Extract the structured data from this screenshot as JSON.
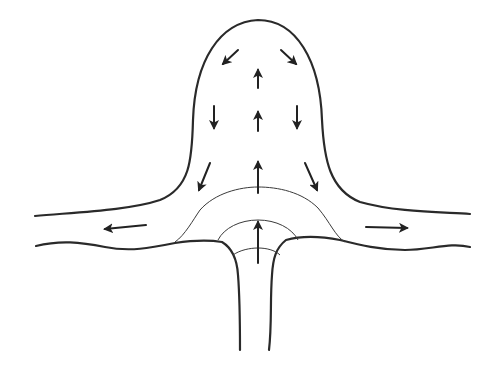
{
  "diagram": {
    "stroke_color": "#2a2a2a",
    "background": "#ffffff",
    "arrows": [
      {
        "id": "head-upper-left",
        "direction": "down-left",
        "x": 230,
        "y": 58
      },
      {
        "id": "head-upper-right",
        "direction": "down-right",
        "x": 290,
        "y": 58
      },
      {
        "id": "head-top-center",
        "direction": "up",
        "x": 258,
        "y": 78
      },
      {
        "id": "head-mid-left",
        "direction": "down",
        "x": 213,
        "y": 112
      },
      {
        "id": "head-mid-center",
        "direction": "up",
        "x": 258,
        "y": 120
      },
      {
        "id": "head-mid-right",
        "direction": "down",
        "x": 298,
        "y": 112
      },
      {
        "id": "head-low-left",
        "direction": "down-left",
        "x": 205,
        "y": 175
      },
      {
        "id": "head-low-center",
        "direction": "up",
        "x": 258,
        "y": 170
      },
      {
        "id": "head-low-right",
        "direction": "down-right",
        "x": 312,
        "y": 175
      },
      {
        "id": "outflow-left",
        "direction": "left",
        "x": 125,
        "y": 227
      },
      {
        "id": "outflow-right",
        "direction": "right",
        "x": 387,
        "y": 227
      },
      {
        "id": "conduit-center",
        "direction": "up",
        "x": 258,
        "y": 240
      }
    ],
    "labels": []
  }
}
